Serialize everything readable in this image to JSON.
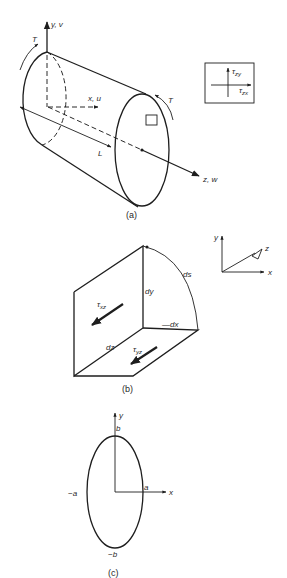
{
  "figure": {
    "panel_a": {
      "caption": "(a)",
      "labels": {
        "y_axis": "y, v",
        "x_axis": "x, u",
        "z_axis": "z, w",
        "length": "L",
        "torque_left": "T",
        "torque_right": "T"
      },
      "inset": {
        "tau": "τ",
        "vertical_sub": "zy",
        "horizontal_sub": "zx"
      }
    },
    "panel_b": {
      "caption": "(b)",
      "labels": {
        "tau": "τ",
        "tau_xz_sub": "xz",
        "tau_yz_sub": "yz",
        "dy": "dy",
        "dx": "dx",
        "dx_prefix": "—",
        "dz": "dz",
        "ds": "ds"
      },
      "axes": {
        "y": "y",
        "x": "x",
        "z": "z"
      }
    },
    "panel_c": {
      "caption": "(c)",
      "labels": {
        "y": "y",
        "x": "x",
        "b": "b",
        "neg_b": "−b",
        "a": "a",
        "neg_a": "−a"
      }
    }
  }
}
